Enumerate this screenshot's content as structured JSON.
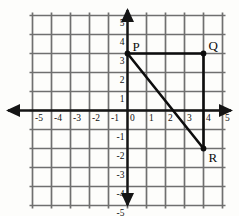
{
  "figure": {
    "kind": "coordinate-plane",
    "background_color": "#fdfdfb",
    "grid_color": "#6f6f6f",
    "axis_color": "#151515",
    "shape_color": "#0d0d0d"
  },
  "chart_data": {
    "type": "scatter",
    "title": "",
    "xlabel": "",
    "ylabel": "",
    "xlim": [
      -5,
      5
    ],
    "ylim": [
      -5,
      5
    ],
    "grid": true,
    "grid_step": 1,
    "legend": "none",
    "x_tick_labels": [
      "-5",
      "-4",
      "-3",
      "-2",
      "-1",
      "0",
      "1",
      "2",
      "3",
      "4",
      "5"
    ],
    "y_tick_labels": [
      "5",
      "4",
      "3",
      "2",
      "1",
      "0",
      "-1",
      "-2",
      "-3",
      "-4",
      "-5"
    ],
    "x_ticks": [
      -5,
      -4,
      -3,
      -2,
      -1,
      0,
      1,
      2,
      3,
      4,
      5
    ],
    "y_ticks": [
      5,
      4,
      3,
      2,
      1,
      0,
      -1,
      -2,
      -3,
      -4,
      -5
    ],
    "points": [
      {
        "name": "P",
        "label": "P",
        "x": 0,
        "y": 3,
        "label_dx": 5,
        "label_dy": -3
      },
      {
        "name": "Q",
        "label": "Q",
        "x": 4,
        "y": 3,
        "label_dx": 5,
        "label_dy": -4
      },
      {
        "name": "R",
        "label": "R",
        "x": 4,
        "y": -2,
        "label_dx": 5,
        "label_dy": 13
      }
    ],
    "segments": [
      {
        "name": "PQ",
        "from": "P",
        "to": "Q",
        "x1": 0,
        "y1": 3,
        "x2": 4,
        "y2": 3
      },
      {
        "name": "QR",
        "from": "Q",
        "to": "R",
        "x1": 4,
        "y1": 3,
        "x2": 4,
        "y2": -2
      },
      {
        "name": "PR",
        "from": "P",
        "to": "R",
        "x1": 0,
        "y1": 3,
        "x2": 4,
        "y2": -2
      }
    ]
  },
  "axis_labels": {
    "x_negative": [
      "-5",
      "-4",
      "-3",
      "-2",
      "-1"
    ],
    "x_origin": "0",
    "x_positive": [
      "1",
      "2",
      "3",
      "4",
      "5"
    ],
    "y_positive": [
      "5",
      "4",
      "3",
      "2",
      "1"
    ],
    "y_negative": [
      "-1",
      "-2",
      "-3",
      "-4",
      "-5"
    ]
  }
}
